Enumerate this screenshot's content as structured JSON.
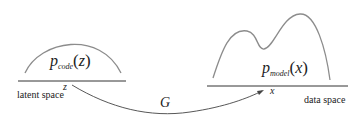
{
  "diagram": {
    "left": {
      "distribution_symbol": "p",
      "distribution_subscript": "code",
      "distribution_arg": "z",
      "axis_point_label": "z",
      "space_label": "latent space"
    },
    "right": {
      "distribution_symbol": "p",
      "distribution_subscript": "model",
      "distribution_arg": "x",
      "axis_point_label": "x",
      "space_label": "data space"
    },
    "mapping_label": "G",
    "colors": {
      "curve": "#8c8c8c",
      "axis": "#333333",
      "arrow": "#444444",
      "text": "#222222"
    }
  }
}
